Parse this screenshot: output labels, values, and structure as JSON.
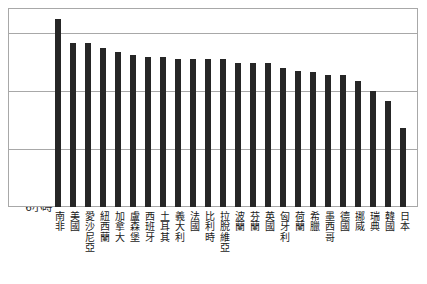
{
  "chart_data": {
    "type": "bar",
    "title": "",
    "subtitle": "",
    "xlabel": "",
    "ylabel": "",
    "ylim": [
      6,
      9.4
    ],
    "grid": true,
    "legend": null,
    "unit_suffix": "小時",
    "ytick_labels": [
      "9小時",
      "8小時",
      "7小時",
      "6小時"
    ],
    "ytick_values": [
      9,
      8,
      7,
      6
    ],
    "categories": [
      "南非",
      "美國",
      "愛沙尼亞",
      "紐西蘭",
      "加拿大",
      "盧森堡",
      "西班牙",
      "土耳其",
      "義大利",
      "法國",
      "比利時",
      "拉脫維亞",
      "波蘭",
      "芬蘭",
      "英國",
      "匈牙利",
      "荷蘭",
      "希臘",
      "墨西哥",
      "德國",
      "挪威",
      "瑞典",
      "韓國",
      "日本"
    ],
    "values": [
      9.25,
      8.82,
      8.83,
      8.75,
      8.67,
      8.62,
      8.58,
      8.58,
      8.55,
      8.55,
      8.55,
      8.55,
      8.48,
      8.48,
      8.48,
      8.4,
      8.35,
      8.32,
      8.28,
      8.28,
      8.17,
      8.0,
      7.82,
      7.37
    ],
    "bar_color": "#262626",
    "grid_color": "#a8a8a8",
    "background_color": "#ffffff"
  }
}
